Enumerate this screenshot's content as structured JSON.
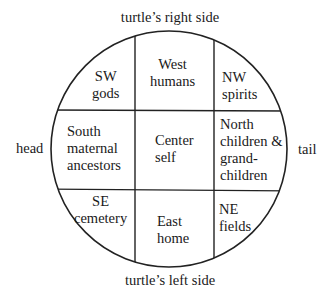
{
  "diagram": {
    "labels": {
      "top": "turtle’s right side",
      "bottom": "turtle’s left side",
      "left": "head",
      "right": "tail"
    },
    "cells": [
      {
        "position": "top-left",
        "direction": "SW",
        "meaning": "gods"
      },
      {
        "position": "top-center",
        "direction": "West",
        "meaning": "humans"
      },
      {
        "position": "top-right",
        "direction": "NW",
        "meaning": "spirits"
      },
      {
        "position": "middle-left",
        "direction": "South",
        "meaning_line1": "maternal",
        "meaning_line2": "ancestors"
      },
      {
        "position": "middle-center",
        "direction": "Center",
        "meaning": "self"
      },
      {
        "position": "middle-right",
        "direction": "North",
        "meaning_line1": "children &",
        "meaning_line2": "grand-",
        "meaning_line3": "children"
      },
      {
        "position": "bottom-left",
        "direction": "SE",
        "meaning": "cemetery"
      },
      {
        "position": "bottom-center",
        "direction": "East",
        "meaning": "home"
      },
      {
        "position": "bottom-right",
        "direction": "NE",
        "meaning": "fields"
      }
    ]
  }
}
